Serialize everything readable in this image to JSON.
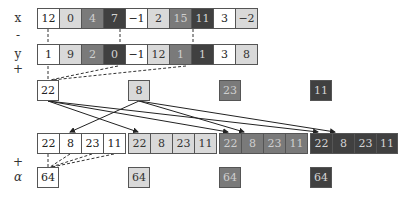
{
  "labels": {
    "x": "x",
    "minus": "-",
    "y": "y",
    "plus_top": "+",
    "plus_bottom": "+",
    "alpha": "α"
  },
  "colors": {
    "shade0": "#ffffff",
    "shade1": "#d9d9d9",
    "shade2": "#7a7a7a",
    "shade3": "#404040"
  },
  "x_row": [
    {
      "value": "12",
      "shade": 0
    },
    {
      "value": "0",
      "shade": 1
    },
    {
      "value": "4",
      "shade": 2
    },
    {
      "value": "7",
      "shade": 3
    },
    {
      "value": "−1",
      "shade": 0
    },
    {
      "value": "2",
      "shade": 1
    },
    {
      "value": "15",
      "shade": 2
    },
    {
      "value": "11",
      "shade": 3
    },
    {
      "value": "3",
      "shade": 0
    },
    {
      "value": "−2",
      "shade": 1
    }
  ],
  "y_row": [
    {
      "value": "1",
      "shade": 0
    },
    {
      "value": "9",
      "shade": 1
    },
    {
      "value": "2",
      "shade": 2
    },
    {
      "value": "0",
      "shade": 3
    },
    {
      "value": "−1",
      "shade": 0
    },
    {
      "value": "12",
      "shade": 1
    },
    {
      "value": "1",
      "shade": 2
    },
    {
      "value": "1",
      "shade": 3
    },
    {
      "value": "3",
      "shade": 0
    },
    {
      "value": "8",
      "shade": 1
    }
  ],
  "partial_sums": [
    {
      "value": "22",
      "shade": 0
    },
    {
      "value": "8",
      "shade": 1
    },
    {
      "value": "23",
      "shade": 2
    },
    {
      "value": "11",
      "shade": 3
    }
  ],
  "gathered_blocks": [
    {
      "shade": 0,
      "values": [
        "22",
        "8",
        "23",
        "11"
      ]
    },
    {
      "shade": 1,
      "values": [
        "22",
        "8",
        "23",
        "11"
      ]
    },
    {
      "shade": 2,
      "values": [
        "22",
        "8",
        "23",
        "11"
      ]
    },
    {
      "shade": 3,
      "values": [
        "22",
        "8",
        "23",
        "11"
      ]
    }
  ],
  "alpha_results": [
    {
      "value": "64",
      "shade": 0
    },
    {
      "value": "64",
      "shade": 1
    },
    {
      "value": "64",
      "shade": 2
    },
    {
      "value": "64",
      "shade": 3
    }
  ]
}
